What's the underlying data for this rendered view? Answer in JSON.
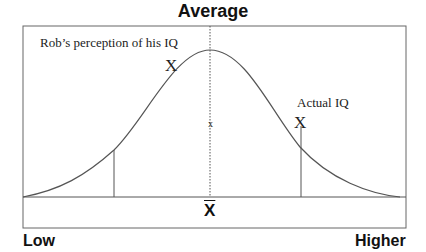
{
  "title": "Average",
  "labels": {
    "perceived": "Rob’s perception of his IQ",
    "actual": "Actual IQ",
    "perceived_marker": "X",
    "actual_marker": "X",
    "mean_small": "x",
    "mean_symbol": "X"
  },
  "axis": {
    "low": "Low",
    "high": "Higher"
  },
  "colors": {
    "line": "#555555",
    "text": "#111111"
  }
}
